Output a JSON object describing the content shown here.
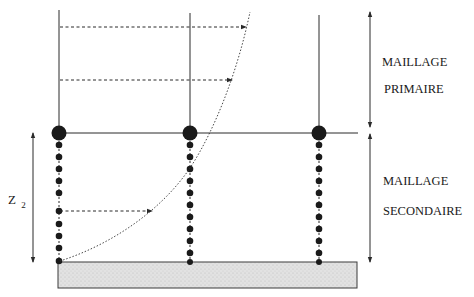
{
  "diagram": {
    "labels": {
      "primary_line1": "MAILLAGE",
      "primary_line2": "PRIMAIRE",
      "secondary_line1": "MAILLAGE",
      "secondary_line2": "SECONDAIRE",
      "z_symbol": "Z",
      "z_subscript": "2"
    },
    "colors": {
      "line": "#2a2a2a",
      "node": "#1a1a1a",
      "base_fill": "#dcdcdc",
      "base_stroke": "#3a3a3a",
      "background": "#ffffff"
    },
    "columns_x": [
      59,
      190,
      319
    ],
    "primary_nodes_y": 133,
    "secondary_nodes_y": [
      145,
      157,
      169,
      181,
      193,
      205,
      212,
      224,
      236,
      248
    ],
    "base": {
      "x": 58,
      "y": 262,
      "width": 299,
      "height": 26
    },
    "dashed_arrows": [
      {
        "x1": 60,
        "y": 27,
        "x2": 247
      },
      {
        "x1": 60,
        "y": 80,
        "x2": 233
      },
      {
        "x1": 60,
        "y": 211,
        "x2": 152
      }
    ],
    "dimension_arrows": [
      {
        "name": "primary-extent",
        "x": 370,
        "y1": 12,
        "y2": 127
      },
      {
        "name": "secondary-extent",
        "x": 370,
        "y1": 134,
        "y2": 262
      },
      {
        "name": "z2-extent",
        "x": 33,
        "y1": 133,
        "y2": 262
      }
    ]
  }
}
